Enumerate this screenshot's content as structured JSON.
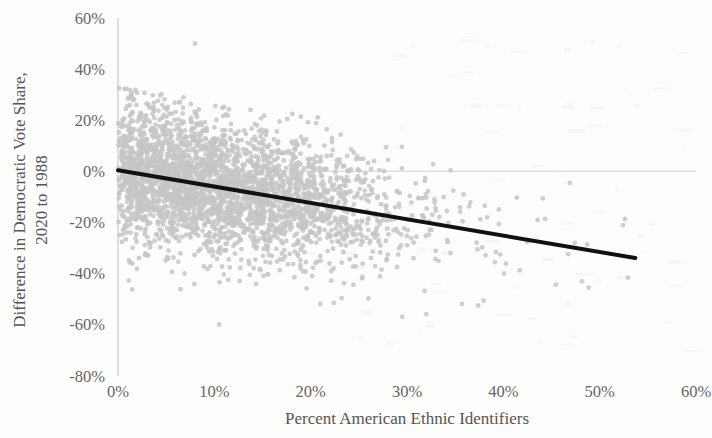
{
  "chart_data": {
    "type": "scatter",
    "title": "",
    "xlabel": "Percent American Ethnic Identifiers",
    "ylabel": "Difference in Democratic Vote Share, 2020 to 1988",
    "ylabel_line1": "Difference in Democratic Vote Share,",
    "ylabel_line2": "2020 to 1988",
    "xlim": [
      0,
      60
    ],
    "ylim": [
      -80,
      60
    ],
    "xticks": [
      0,
      10,
      20,
      30,
      40,
      50,
      60
    ],
    "yticks": [
      60,
      40,
      20,
      0,
      -20,
      -40,
      -60,
      -80
    ],
    "xtick_labels": [
      "0%",
      "10%",
      "20%",
      "30%",
      "40%",
      "50%",
      "60%"
    ],
    "ytick_labels": [
      "60%",
      "40%",
      "20%",
      "0%",
      "-20%",
      "-40%",
      "-60%",
      "-80%"
    ],
    "grid": false,
    "zero_line": true,
    "zero_line_y": 0,
    "zero_line_x_end": 60,
    "legend": "none",
    "point_color": "#c6c6c6",
    "point_radius": 2.4,
    "point_opacity": 0.85,
    "n_points": 3100,
    "axis_color": "#c9c9c9",
    "trendline": {
      "color": "#111111",
      "width": 4,
      "x_start": 0,
      "y_start": 0.4,
      "x_end": 53.7,
      "y_end": -34.0,
      "slope": -0.64,
      "intercept": 0.4
    },
    "cloud": {
      "x_min": 0,
      "x_core_max": 28,
      "x_tail_max": 54,
      "y_center_at_x0": 1,
      "y_spread_core": 14,
      "y_top_env": 33,
      "y_bottom_env": -46,
      "outlier_high": {
        "x": 8.0,
        "y": 50
      },
      "outliers_low": [
        {
          "x": 10.5,
          "y": -60
        },
        {
          "x": 29.5,
          "y": -57
        },
        {
          "x": 32.0,
          "y": -56
        },
        {
          "x": 21.0,
          "y": -52
        }
      ],
      "density_profile": [
        {
          "x": 2,
          "weight": 0.95
        },
        {
          "x": 6,
          "weight": 1.0
        },
        {
          "x": 10,
          "weight": 0.95
        },
        {
          "x": 14,
          "weight": 0.8
        },
        {
          "x": 18,
          "weight": 0.6
        },
        {
          "x": 22,
          "weight": 0.38
        },
        {
          "x": 26,
          "weight": 0.2
        },
        {
          "x": 30,
          "weight": 0.1
        },
        {
          "x": 36,
          "weight": 0.05
        },
        {
          "x": 44,
          "weight": 0.02
        },
        {
          "x": 52,
          "weight": 0.01
        }
      ]
    }
  }
}
